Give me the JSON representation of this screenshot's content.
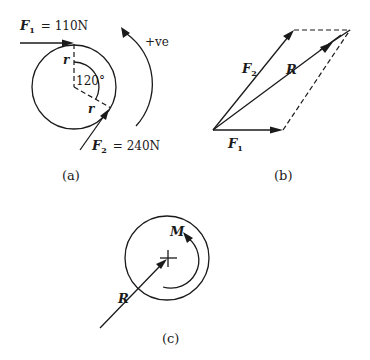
{
  "figure": {
    "panels": [
      {
        "id": "a",
        "caption": "(a)",
        "force1": {
          "symbol": "F",
          "subscript": "1",
          "equals": "= 110N"
        },
        "force2": {
          "symbol": "F",
          "subscript": "2",
          "equals": "= 240N"
        },
        "radius_label": "r",
        "angle_label": "120°",
        "direction_label": "+ve"
      },
      {
        "id": "b",
        "caption": "(b)",
        "force1": {
          "symbol": "F",
          "subscript": "1"
        },
        "force2": {
          "symbol": "F",
          "subscript": "2"
        },
        "resultant": "R"
      },
      {
        "id": "c",
        "caption": "(c)",
        "resultant": "R",
        "moment": "M"
      }
    ]
  },
  "colors": {
    "ink": "#1a1a1a",
    "background": "#ffffff"
  }
}
